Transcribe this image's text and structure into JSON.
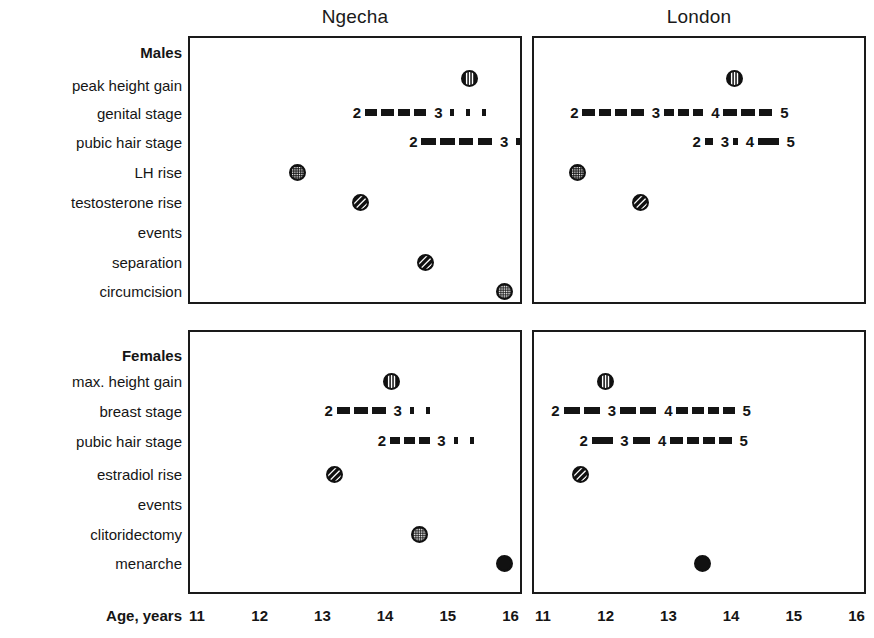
{
  "figure": {
    "axis_label": "Age, years",
    "panels": [
      {
        "key": "ngecha",
        "title": "Ngecha"
      },
      {
        "key": "london",
        "title": "London"
      }
    ],
    "groups": [
      {
        "key": "males",
        "label": "Males"
      },
      {
        "key": "females",
        "label": "Females"
      }
    ],
    "row_labels_males": [
      "peak height gain",
      "genital stage",
      "pubic hair stage",
      "LH rise",
      "testosterone rise",
      "events",
      "separation",
      "circumcision"
    ],
    "row_labels_females": [
      "max. height gain",
      "breast stage",
      "pubic hair stage",
      "estradiol rise",
      "events",
      "clitoridectomy",
      "menarche"
    ],
    "x_ticks": [
      "11",
      "12",
      "13",
      "14",
      "15",
      "16"
    ]
  },
  "chart_data": {
    "type": "scatter",
    "xlabel": "Age, years",
    "ylabel": "",
    "xlim": [
      10.7,
      16.3
    ],
    "x_ticks": [
      11,
      12,
      13,
      14,
      15,
      16
    ],
    "grid": false,
    "legend": "none",
    "panels": [
      {
        "panel": "Ngecha",
        "sex": "Males",
        "point_events": [
          {
            "label": "peak height gain",
            "age": 15.35,
            "marker": "vertical-striped-circle"
          },
          {
            "label": "LH rise",
            "age": 12.6,
            "marker": "stippled-circle"
          },
          {
            "label": "testosterone rise",
            "age": 13.6,
            "marker": "diagonal-hatched-circle"
          },
          {
            "label": "separation",
            "age": 14.65,
            "marker": "diagonal-hatched-circle"
          },
          {
            "label": "circumcision",
            "age": 15.9,
            "marker": "crosshatched-circle"
          }
        ],
        "stage_scales": [
          {
            "label": "genital stage",
            "stages": [
              "2",
              "3"
            ],
            "stage_ages": [
              13.55,
              14.85
            ],
            "solid_to": 14.85,
            "dotted_to": 15.7
          },
          {
            "label": "pubic hair stage",
            "stages": [
              "2",
              "3"
            ],
            "stage_ages": [
              14.45,
              15.9
            ],
            "solid_to": 15.9,
            "dotted_to": 16.15
          }
        ]
      },
      {
        "panel": "London",
        "sex": "Males",
        "point_events": [
          {
            "label": "peak height gain",
            "age": 14.05,
            "marker": "vertical-striped-circle"
          },
          {
            "label": "LH rise",
            "age": 11.55,
            "marker": "stippled-circle"
          },
          {
            "label": "testosterone rise",
            "age": 12.55,
            "marker": "diagonal-hatched-circle"
          }
        ],
        "stage_scales": [
          {
            "label": "genital stage",
            "stages": [
              "2",
              "3",
              "4",
              "5"
            ],
            "stage_ages": [
              11.5,
              12.8,
              13.75,
              14.85
            ],
            "solid_to": 14.85,
            "dotted_to": null
          },
          {
            "label": "pubic hair stage",
            "stages": [
              "2",
              "3",
              "4",
              "5"
            ],
            "stage_ages": [
              13.45,
              13.9,
              14.3,
              14.95
            ],
            "solid_to": 14.95,
            "dotted_to": null
          }
        ]
      },
      {
        "panel": "Ngecha",
        "sex": "Females",
        "point_events": [
          {
            "label": "max. height gain",
            "age": 14.1,
            "marker": "vertical-striped-circle"
          },
          {
            "label": "estradiol rise",
            "age": 13.2,
            "marker": "diagonal-hatched-circle"
          },
          {
            "label": "clitoridectomy",
            "age": 14.55,
            "marker": "crosshatched-circle"
          },
          {
            "label": "menarche",
            "age": 15.9,
            "marker": "solid-circle"
          }
        ],
        "stage_scales": [
          {
            "label": "breast stage",
            "stages": [
              "2",
              "3"
            ],
            "stage_ages": [
              13.1,
              14.2
            ],
            "solid_to": 14.2,
            "dotted_to": 15.0
          },
          {
            "label": "pubic hair stage",
            "stages": [
              "2",
              "3"
            ],
            "stage_ages": [
              13.95,
              14.9
            ],
            "solid_to": 14.9,
            "dotted_to": 15.7
          }
        ]
      },
      {
        "panel": "London",
        "sex": "Females",
        "point_events": [
          {
            "label": "max. height gain",
            "age": 12.0,
            "marker": "vertical-striped-circle"
          },
          {
            "label": "estradiol rise",
            "age": 11.6,
            "marker": "diagonal-hatched-circle"
          },
          {
            "label": "menarche",
            "age": 13.55,
            "marker": "solid-circle"
          }
        ],
        "stage_scales": [
          {
            "label": "breast stage",
            "stages": [
              "2",
              "3",
              "4",
              "5"
            ],
            "stage_ages": [
              11.2,
              12.1,
              13.0,
              14.25
            ],
            "solid_to": 14.25,
            "dotted_to": null
          },
          {
            "label": "pubic hair stage",
            "stages": [
              "2",
              "3",
              "4",
              "5"
            ],
            "stage_ages": [
              11.65,
              12.3,
              12.9,
              14.2
            ],
            "solid_to": 14.2,
            "dotted_to": null
          }
        ]
      }
    ]
  },
  "colors": {
    "ink": "#141414",
    "frame": "#1a1a1a",
    "background": "#ffffff"
  }
}
